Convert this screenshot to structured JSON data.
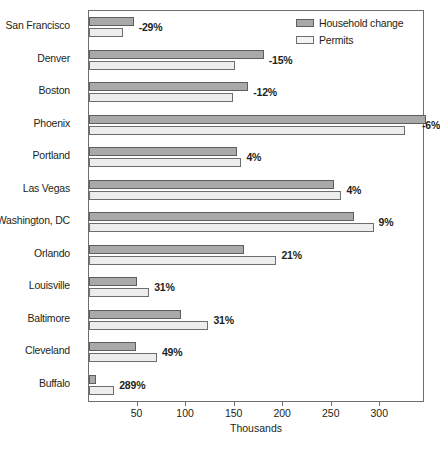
{
  "chart_data": {
    "type": "bar",
    "orientation": "horizontal",
    "title": "",
    "xlabel": "Thousands",
    "ylabel": "",
    "xlim": [
      0,
      345
    ],
    "xticks": [
      50,
      100,
      150,
      200,
      250,
      300
    ],
    "xtick_labels": [
      "50",
      "100",
      "150",
      "200",
      "250",
      "300"
    ],
    "grid": false,
    "legend_position": "top-right",
    "categories": [
      "San Francisco",
      "Denver",
      "Boston",
      "Phoenix",
      "Portland",
      "Las Vegas",
      "Washington, DC",
      "Orlando",
      "Louisville",
      "Baltimore",
      "Cleveland",
      "Buffalo"
    ],
    "series": [
      {
        "name": "Household change",
        "color": "#a9a9a9",
        "values": [
          46,
          180,
          164,
          347,
          152,
          252,
          273,
          160,
          49,
          95,
          48,
          7
        ]
      },
      {
        "name": "Permits",
        "color": "#ededed",
        "values": [
          35,
          150,
          148,
          325,
          157,
          260,
          293,
          193,
          62,
          123,
          70,
          26
        ]
      }
    ],
    "annotations": [
      "-29%",
      "-15%",
      "-12%",
      "-6%",
      "4%",
      "4%",
      "9%",
      "21%",
      "31%",
      "31%",
      "49%",
      "289%"
    ]
  },
  "legend": {
    "items": [
      {
        "label": "Household change",
        "swatch": "household-swatch"
      },
      {
        "label": "Permits",
        "swatch": "permits-swatch"
      }
    ]
  },
  "axis": {
    "title": "Thousands"
  }
}
